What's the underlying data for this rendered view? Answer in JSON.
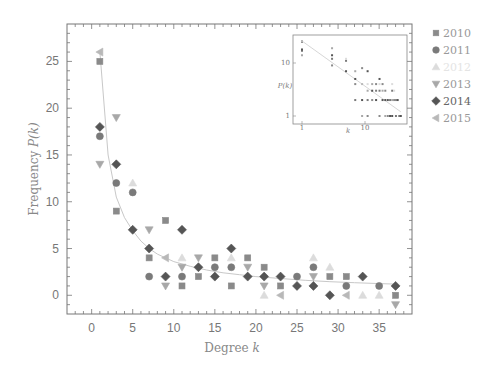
{
  "chart_data": {
    "type": "scatter",
    "title": "",
    "xlabel": "Degree k",
    "ylabel": "Frequency P(k)",
    "xlim": [
      -3,
      39
    ],
    "ylim": [
      -2,
      29
    ],
    "xticks": [
      0,
      5,
      10,
      15,
      20,
      25,
      30,
      35
    ],
    "yticks": [
      0,
      5,
      10,
      15,
      20,
      25
    ],
    "grid": false,
    "legend_position": "right-outside",
    "series": [
      {
        "name": "2010",
        "marker": "square",
        "color": "#8a8a8a",
        "points": [
          [
            1,
            25
          ],
          [
            3,
            9
          ],
          [
            7,
            4
          ],
          [
            9,
            8
          ],
          [
            11,
            1
          ],
          [
            13,
            2
          ],
          [
            15,
            4
          ],
          [
            17,
            1
          ],
          [
            19,
            4
          ],
          [
            21,
            3
          ],
          [
            23,
            1
          ],
          [
            29,
            2
          ],
          [
            31,
            2
          ],
          [
            37,
            0
          ]
        ]
      },
      {
        "name": "2011",
        "marker": "circle",
        "color": "#7a7a7a",
        "points": [
          [
            1,
            17
          ],
          [
            3,
            12
          ],
          [
            5,
            11
          ],
          [
            7,
            2
          ],
          [
            11,
            2
          ],
          [
            15,
            3
          ],
          [
            17,
            3
          ],
          [
            25,
            2
          ],
          [
            27,
            3
          ],
          [
            31,
            1
          ],
          [
            35,
            1
          ]
        ]
      },
      {
        "name": "2012",
        "marker": "triangle-up",
        "color": "#dcdcdc",
        "points": [
          [
            5,
            12
          ],
          [
            11,
            4
          ],
          [
            17,
            4
          ],
          [
            21,
            0
          ],
          [
            27,
            4
          ],
          [
            29,
            3
          ],
          [
            33,
            0
          ],
          [
            35,
            0
          ]
        ]
      },
      {
        "name": "2013",
        "marker": "triangle-down",
        "color": "#a8a8a8",
        "points": [
          [
            1,
            14
          ],
          [
            3,
            19
          ],
          [
            7,
            7
          ],
          [
            9,
            1
          ],
          [
            11,
            3
          ],
          [
            13,
            4
          ],
          [
            19,
            3
          ],
          [
            21,
            1
          ],
          [
            27,
            2
          ],
          [
            37,
            -1
          ]
        ]
      },
      {
        "name": "2014",
        "marker": "diamond",
        "color": "#555555",
        "points": [
          [
            1,
            18
          ],
          [
            3,
            14
          ],
          [
            5,
            7
          ],
          [
            7,
            5
          ],
          [
            9,
            2
          ],
          [
            11,
            7
          ],
          [
            13,
            3
          ],
          [
            15,
            2
          ],
          [
            17,
            5
          ],
          [
            19,
            2
          ],
          [
            21,
            2
          ],
          [
            23,
            2
          ],
          [
            25,
            1
          ],
          [
            27,
            1
          ],
          [
            29,
            0
          ],
          [
            33,
            2
          ],
          [
            37,
            1
          ]
        ]
      },
      {
        "name": "2015",
        "marker": "triangle-left",
        "color": "#b8b8b8",
        "points": [
          [
            1,
            26
          ],
          [
            9,
            4
          ],
          [
            23,
            0
          ],
          [
            31,
            0
          ]
        ]
      }
    ],
    "fit_curve": {
      "type": "power-law",
      "color": "#c8c8c8",
      "points": [
        [
          1,
          26
        ],
        [
          2,
          15
        ],
        [
          3,
          10.5
        ],
        [
          4,
          8.3
        ],
        [
          5,
          6.9
        ],
        [
          6,
          5.8
        ],
        [
          7,
          5
        ],
        [
          8,
          4.4
        ],
        [
          9,
          4
        ],
        [
          10,
          3.6
        ],
        [
          12,
          3.1
        ],
        [
          14,
          2.7
        ],
        [
          16,
          2.4
        ],
        [
          18,
          2.2
        ],
        [
          20,
          2
        ],
        [
          23,
          1.8
        ],
        [
          26,
          1.6
        ],
        [
          29,
          1.45
        ],
        [
          32,
          1.35
        ],
        [
          35,
          1.25
        ],
        [
          37,
          1.2
        ]
      ]
    },
    "inset": {
      "type": "scatter-loglog",
      "xlabel": "k",
      "ylabel": "P(k)",
      "xticks": [
        "1",
        "10"
      ],
      "yticks": [
        "1",
        "10"
      ]
    }
  },
  "legend": {
    "items": [
      {
        "label": "2010",
        "marker": "square",
        "color": "#8a8a8a"
      },
      {
        "label": "2011",
        "marker": "circle",
        "color": "#7a7a7a"
      },
      {
        "label": "2012",
        "marker": "triangle-up",
        "color": "#dcdcdc"
      },
      {
        "label": "2013",
        "marker": "triangle-down",
        "color": "#a8a8a8"
      },
      {
        "label": "2014",
        "marker": "diamond",
        "color": "#555555"
      },
      {
        "label": "2015",
        "marker": "triangle-left",
        "color": "#b8b8b8"
      }
    ]
  },
  "axes": {
    "xlabel_main": "Degree ",
    "xlabel_var": "k",
    "ylabel_main": "Frequency ",
    "ylabel_var": "P(k)",
    "inset_xlabel": "k",
    "inset_ylabel": "P(k)",
    "inset_xtick_1": "1",
    "inset_xtick_10": "10",
    "inset_ytick_1": "1",
    "inset_ytick_10": "10"
  }
}
